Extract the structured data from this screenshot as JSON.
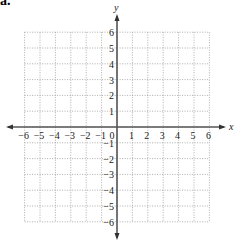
{
  "figure": {
    "label_fragment": "a."
  },
  "chart_data": {
    "type": "scatter",
    "title": "",
    "xlabel": "x",
    "ylabel": "y",
    "xlim": [
      -6,
      6
    ],
    "ylim": [
      -6,
      6
    ],
    "grid": true,
    "grid_style": "dotted",
    "x_ticks": [
      -6,
      -5,
      -4,
      -3,
      -2,
      -1,
      0,
      1,
      2,
      3,
      4,
      5,
      6
    ],
    "y_ticks": [
      -6,
      -5,
      -4,
      -3,
      -2,
      -1,
      1,
      2,
      3,
      4,
      5,
      6
    ],
    "x_tick_labels": [
      "−6",
      "−5",
      "−4",
      "−3",
      "−2",
      "−1",
      "0",
      "1",
      "2",
      "3",
      "4",
      "5",
      "6"
    ],
    "y_tick_labels": [
      "−6",
      "−5",
      "−4",
      "−3",
      "−2",
      "−1",
      "1",
      "2",
      "3",
      "4",
      "5",
      "6"
    ],
    "series": [],
    "axis_color": "#555555",
    "grid_color": "#999999"
  }
}
